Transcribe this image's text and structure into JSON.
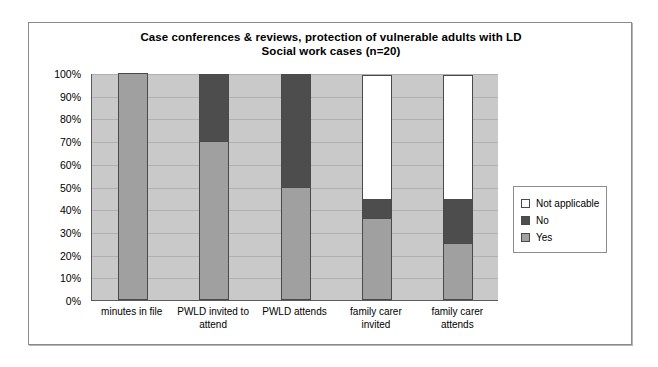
{
  "chart_data": {
    "type": "bar",
    "subtype": "stacked-percent",
    "title": "Case conferences & reviews, protection of vulnerable adults with LD",
    "subtitle": "Social work cases (n=20)",
    "xlabel": "",
    "ylabel": "",
    "ylim": [
      0,
      100
    ],
    "ytick_labels": [
      "100%",
      "90%",
      "80%",
      "70%",
      "60%",
      "50%",
      "40%",
      "30%",
      "20%",
      "10%",
      "0%"
    ],
    "ytick_values": [
      100,
      90,
      80,
      70,
      60,
      50,
      40,
      30,
      20,
      10,
      0
    ],
    "grid": true,
    "legend_position": "right",
    "categories": [
      "minutes in file",
      "PWLD invited to attend",
      "PWLD attends",
      "family carer invited",
      "family carer attends"
    ],
    "series": [
      {
        "name": "Yes",
        "color": "#a0a0a0",
        "values": [
          100,
          70,
          50,
          36,
          25
        ]
      },
      {
        "name": "No",
        "color": "#4d4d4d",
        "values": [
          0,
          30,
          50,
          9,
          20
        ]
      },
      {
        "name": "Not applicable",
        "color": "#ffffff",
        "values": [
          0,
          0,
          0,
          55,
          55
        ]
      }
    ],
    "stack_order_bottom_to_top": [
      "Yes",
      "No",
      "Not applicable"
    ],
    "legend_order_top_to_bottom": [
      "Not applicable",
      "No",
      "Yes"
    ],
    "plot_background": "#c9c9c9",
    "axis_color": "#5b5b5b",
    "bar_border_color": "#4a4a4a"
  },
  "legend": {
    "items": [
      {
        "label": "Not applicable",
        "color": "#ffffff"
      },
      {
        "label": "No",
        "color": "#4d4d4d"
      },
      {
        "label": "Yes",
        "color": "#a0a0a0"
      }
    ]
  }
}
